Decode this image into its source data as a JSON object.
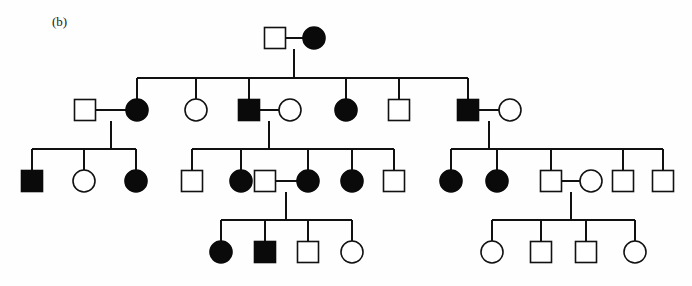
{
  "figure": {
    "panel_label": "(b)",
    "label_x": 52,
    "label_y": 26,
    "width": 692,
    "height": 286,
    "background_color": "#fefefe",
    "line_color": "#111111",
    "affected_fill": "#0a0a0a",
    "unaffected_fill": "#ffffff",
    "chart_type": "pedigree",
    "trait_pattern": "autosomal dominant",
    "square_size": 21,
    "circle_radius": 11,
    "generation_y": [
      38,
      110,
      181,
      252
    ]
  },
  "individuals": [
    {
      "id": "I-1",
      "sex": "male",
      "affected": false,
      "generation": 1,
      "x": 275,
      "y": 38,
      "name": "gen1-male-unaffected"
    },
    {
      "id": "I-2",
      "sex": "female",
      "affected": true,
      "generation": 1,
      "x": 314,
      "y": 38,
      "name": "gen1-female-affected"
    },
    {
      "id": "II-a",
      "sex": "male",
      "affected": false,
      "generation": 2,
      "x": 85,
      "y": 110,
      "name": "gen2-spouse-male-unaffected"
    },
    {
      "id": "II-1",
      "sex": "female",
      "affected": true,
      "generation": 2,
      "x": 137,
      "y": 110,
      "name": "gen2-female-affected-1"
    },
    {
      "id": "II-2",
      "sex": "female",
      "affected": false,
      "generation": 2,
      "x": 196,
      "y": 110,
      "name": "gen2-female-unaffected-1"
    },
    {
      "id": "II-3",
      "sex": "male",
      "affected": true,
      "generation": 2,
      "x": 249,
      "y": 110,
      "name": "gen2-male-affected-1"
    },
    {
      "id": "II-b",
      "sex": "female",
      "affected": false,
      "generation": 2,
      "x": 290,
      "y": 110,
      "name": "gen2-spouse-female-unaffected-1"
    },
    {
      "id": "II-4",
      "sex": "female",
      "affected": true,
      "generation": 2,
      "x": 346,
      "y": 110,
      "name": "gen2-female-affected-2"
    },
    {
      "id": "II-5",
      "sex": "male",
      "affected": false,
      "generation": 2,
      "x": 399,
      "y": 110,
      "name": "gen2-male-unaffected-1"
    },
    {
      "id": "II-6",
      "sex": "male",
      "affected": true,
      "generation": 2,
      "x": 468,
      "y": 110,
      "name": "gen2-male-affected-2"
    },
    {
      "id": "II-c",
      "sex": "female",
      "affected": false,
      "generation": 2,
      "x": 510,
      "y": 110,
      "name": "gen2-spouse-female-unaffected-2"
    },
    {
      "id": "III-1",
      "sex": "male",
      "affected": true,
      "generation": 3,
      "x": 32,
      "y": 181,
      "name": "gen3-male-affected-1"
    },
    {
      "id": "III-2",
      "sex": "female",
      "affected": false,
      "generation": 3,
      "x": 84,
      "y": 181,
      "name": "gen3-female-unaffected-1"
    },
    {
      "id": "III-3",
      "sex": "female",
      "affected": true,
      "generation": 3,
      "x": 136,
      "y": 181,
      "name": "gen3-female-affected-1"
    },
    {
      "id": "III-4",
      "sex": "male",
      "affected": false,
      "generation": 3,
      "x": 192,
      "y": 181,
      "name": "gen3-male-unaffected-1"
    },
    {
      "id": "III-5",
      "sex": "female",
      "affected": true,
      "generation": 3,
      "x": 241,
      "y": 181,
      "name": "gen3-female-affected-2"
    },
    {
      "id": "III-6",
      "sex": "male",
      "affected": false,
      "generation": 3,
      "x": 265,
      "y": 181,
      "name": "gen3-male-unaffected-2"
    },
    {
      "id": "III-7",
      "sex": "female",
      "affected": true,
      "generation": 3,
      "x": 308,
      "y": 181,
      "name": "gen3-female-affected-3"
    },
    {
      "id": "III-8",
      "sex": "female",
      "affected": true,
      "generation": 3,
      "x": 352,
      "y": 181,
      "name": "gen3-female-affected-4"
    },
    {
      "id": "III-9",
      "sex": "male",
      "affected": false,
      "generation": 3,
      "x": 394,
      "y": 181,
      "name": "gen3-male-unaffected-3"
    },
    {
      "id": "III-10",
      "sex": "female",
      "affected": true,
      "generation": 3,
      "x": 451,
      "y": 181,
      "name": "gen3-female-affected-5"
    },
    {
      "id": "III-11",
      "sex": "female",
      "affected": true,
      "generation": 3,
      "x": 497,
      "y": 181,
      "name": "gen3-female-affected-6"
    },
    {
      "id": "III-12",
      "sex": "male",
      "affected": false,
      "generation": 3,
      "x": 551,
      "y": 181,
      "name": "gen3-male-unaffected-4"
    },
    {
      "id": "III-13",
      "sex": "female",
      "affected": false,
      "generation": 3,
      "x": 591,
      "y": 181,
      "name": "gen3-spouse-female-unaffected"
    },
    {
      "id": "III-14",
      "sex": "male",
      "affected": false,
      "generation": 3,
      "x": 623,
      "y": 181,
      "name": "gen3-male-unaffected-5"
    },
    {
      "id": "III-15",
      "sex": "male",
      "affected": false,
      "generation": 3,
      "x": 663,
      "y": 181,
      "name": "gen3-male-unaffected-6"
    },
    {
      "id": "IV-1",
      "sex": "female",
      "affected": true,
      "generation": 4,
      "x": 221,
      "y": 252,
      "name": "gen4-female-affected-1"
    },
    {
      "id": "IV-2",
      "sex": "male",
      "affected": true,
      "generation": 4,
      "x": 265,
      "y": 252,
      "name": "gen4-male-affected-1"
    },
    {
      "id": "IV-3",
      "sex": "male",
      "affected": false,
      "generation": 4,
      "x": 308,
      "y": 252,
      "name": "gen4-male-unaffected-1"
    },
    {
      "id": "IV-4",
      "sex": "female",
      "affected": false,
      "generation": 4,
      "x": 352,
      "y": 252,
      "name": "gen4-female-unaffected-1"
    },
    {
      "id": "IV-5",
      "sex": "female",
      "affected": false,
      "generation": 4,
      "x": 492,
      "y": 252,
      "name": "gen4-female-unaffected-2"
    },
    {
      "id": "IV-6",
      "sex": "male",
      "affected": false,
      "generation": 4,
      "x": 541,
      "y": 252,
      "name": "gen4-male-unaffected-2"
    },
    {
      "id": "IV-7",
      "sex": "male",
      "affected": false,
      "generation": 4,
      "x": 586,
      "y": 252,
      "name": "gen4-male-unaffected-3"
    },
    {
      "id": "IV-8",
      "sex": "female",
      "affected": false,
      "generation": 4,
      "x": 635,
      "y": 252,
      "name": "gen4-female-unaffected-4"
    }
  ],
  "mating_lines": [
    {
      "name": "mating-gen1",
      "x1": 286,
      "x2": 303,
      "y": 38
    },
    {
      "name": "mating-gen2-left",
      "x1": 96,
      "x2": 126,
      "y": 110
    },
    {
      "name": "mating-gen2-mid",
      "x1": 260,
      "x2": 279,
      "y": 110
    },
    {
      "name": "mating-gen2-right",
      "x1": 479,
      "x2": 499,
      "y": 110
    },
    {
      "name": "mating-gen3-mid",
      "x1": 276,
      "x2": 297,
      "y": 181
    },
    {
      "name": "mating-gen3-right",
      "x1": 562,
      "x2": 580,
      "y": 181
    }
  ],
  "descent_drops": [
    {
      "name": "drop-gen1-to-sibline",
      "x": 294,
      "y1": 38,
      "y2": 78
    },
    {
      "name": "drop-gen2-left-to-sibline",
      "x": 111,
      "y1": 110,
      "y2": 149
    },
    {
      "name": "drop-gen2-mid-to-sibline",
      "x": 269,
      "y1": 110,
      "y2": 149
    },
    {
      "name": "drop-gen2-right-to-sibline",
      "x": 489,
      "y1": 110,
      "y2": 149
    },
    {
      "name": "drop-gen3-mid-to-sibline",
      "x": 286,
      "y1": 181,
      "y2": 220
    },
    {
      "name": "drop-gen3-right-to-sibline",
      "x": 571,
      "y1": 181,
      "y2": 220
    }
  ],
  "sibship_lines": [
    {
      "name": "sibline-gen2",
      "y": 78,
      "x1": 137,
      "x2": 468,
      "children_x": [
        137,
        196,
        249,
        346,
        399,
        468
      ],
      "child_y": 110
    },
    {
      "name": "sibline-gen3-left",
      "y": 149,
      "x1": 32,
      "x2": 136,
      "children_x": [
        32,
        84,
        136
      ],
      "child_y": 181
    },
    {
      "name": "sibline-gen3-mid",
      "y": 149,
      "x1": 192,
      "x2": 394,
      "children_x": [
        192,
        241,
        308,
        352,
        394
      ],
      "child_y": 181
    },
    {
      "name": "sibline-gen3-right",
      "y": 149,
      "x1": 451,
      "x2": 663,
      "children_x": [
        451,
        497,
        551,
        623,
        663
      ],
      "child_y": 181
    },
    {
      "name": "sibline-gen4-mid",
      "y": 220,
      "x1": 221,
      "x2": 352,
      "children_x": [
        221,
        265,
        308,
        352
      ],
      "child_y": 252
    },
    {
      "name": "sibline-gen4-right",
      "y": 220,
      "x1": 492,
      "x2": 635,
      "children_x": [
        492,
        541,
        586,
        635
      ],
      "child_y": 252
    }
  ],
  "legend": {
    "square_meaning": "male",
    "circle_meaning": "female",
    "filled_meaning": "affected",
    "open_meaning": "unaffected"
  }
}
